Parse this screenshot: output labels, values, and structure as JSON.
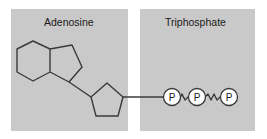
{
  "diagram": {
    "sections": [
      {
        "label": "Adenosine",
        "color": "#c9c9c9"
      },
      {
        "label": "Triphosphate",
        "color": "#c9c9c9"
      }
    ],
    "phosphate_label": "P",
    "phosphate_count": 3,
    "components": [
      "adenine (hexagon + pentagon rings)",
      "ribose (pentagon)",
      "phosphate groups x3 with high-energy bonds"
    ],
    "line_color": "#3a3a3a"
  }
}
